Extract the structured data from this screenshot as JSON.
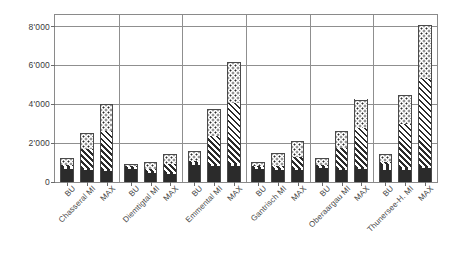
{
  "title": "",
  "chart_data": {
    "type": "bar",
    "subtype": "stacked-grouped",
    "title": "",
    "xlabel": "",
    "ylabel": "",
    "ylim": [
      0,
      8600
    ],
    "yticks": [
      0,
      2000,
      4000,
      6000,
      8000
    ],
    "ytick_labels": [
      "0",
      "2'000",
      "4'000",
      "6'000",
      "8'000"
    ],
    "grid": true,
    "grid_axis": "y",
    "legend": "none",
    "groups": [
      "Chasseral MI",
      "Diemtigtal MI",
      "Emmental MI",
      "Gantrisch MI",
      "Oberaargau MI",
      "Thunersee-H. MI"
    ],
    "bar_labels": [
      "BU",
      "MI",
      "MAX"
    ],
    "categories": [
      "BU",
      "Chasseral MI",
      "MAX",
      "BU",
      "Diemtigtal MI",
      "MAX",
      "BU",
      "Emmental MI",
      "MAX",
      "BU",
      "Gantrisch MI",
      "MAX",
      "BU",
      "Oberaargau MI",
      "MAX",
      "BU",
      "Thunersee-H. MI",
      "MAX"
    ],
    "series": [
      {
        "name": "segment-1-solid",
        "pattern": "solid-black",
        "values": [
          680,
          610,
          580,
          660,
          460,
          430,
          880,
          840,
          850,
          660,
          620,
          620,
          730,
          640,
          650,
          600,
          630,
          700
        ]
      },
      {
        "name": "segment-2-dashed",
        "pattern": "dashed-rows",
        "values": [
          120,
          100,
          95,
          100,
          90,
          90,
          130,
          110,
          110,
          110,
          100,
          100,
          110,
          100,
          100,
          350,
          120,
          110
        ]
      },
      {
        "name": "segment-3-hatched",
        "pattern": "diagonal-hatch",
        "values": [
          60,
          990,
          1940,
          50,
          110,
          430,
          60,
          1430,
          3090,
          60,
          130,
          560,
          60,
          1000,
          2050,
          60,
          2250,
          4520
        ]
      },
      {
        "name": "segment-4-dotted",
        "pattern": "dotted",
        "values": [
          370,
          800,
          1420,
          110,
          370,
          500,
          540,
          1370,
          2150,
          220,
          660,
          810,
          320,
          900,
          1450,
          440,
          1480,
          2770
        ]
      }
    ],
    "totals": [
      1230,
      2500,
      4035,
      920,
      1030,
      1450,
      1610,
      3750,
      6200,
      1050,
      1510,
      2090,
      1220,
      2640,
      4250,
      1450,
      4480,
      8100
    ]
  },
  "bars": [
    {
      "group": "Chasseral MI",
      "label": "BU",
      "segments": [
        680,
        120,
        60,
        370
      ],
      "total": 1230
    },
    {
      "group": "Chasseral MI",
      "label": "MI",
      "segments": [
        610,
        100,
        990,
        800
      ],
      "total": 2500
    },
    {
      "group": "Chasseral MI",
      "label": "MAX",
      "segments": [
        580,
        95,
        1940,
        1420
      ],
      "total": 4035
    },
    {
      "group": "Diemtigtal MI",
      "label": "BU",
      "segments": [
        660,
        100,
        50,
        110
      ],
      "total": 920
    },
    {
      "group": "Diemtigtal MI",
      "label": "MI",
      "segments": [
        460,
        90,
        110,
        370
      ],
      "total": 1030
    },
    {
      "group": "Diemtigtal MI",
      "label": "MAX",
      "segments": [
        430,
        90,
        430,
        500
      ],
      "total": 1450
    },
    {
      "group": "Emmental MI",
      "label": "BU",
      "segments": [
        880,
        130,
        60,
        540
      ],
      "total": 1610
    },
    {
      "group": "Emmental MI",
      "label": "MI",
      "segments": [
        840,
        110,
        1430,
        1370
      ],
      "total": 3750
    },
    {
      "group": "Emmental MI",
      "label": "MAX",
      "segments": [
        850,
        110,
        3090,
        2150
      ],
      "total": 6200
    },
    {
      "group": "Gantrisch MI",
      "label": "BU",
      "segments": [
        660,
        110,
        60,
        220
      ],
      "total": 1050
    },
    {
      "group": "Gantrisch MI",
      "label": "MI",
      "segments": [
        620,
        100,
        130,
        660
      ],
      "total": 1510
    },
    {
      "group": "Gantrisch MI",
      "label": "MAX",
      "segments": [
        620,
        100,
        560,
        810
      ],
      "total": 2090
    },
    {
      "group": "Oberaargau MI",
      "label": "BU",
      "segments": [
        730,
        110,
        60,
        320
      ],
      "total": 1220
    },
    {
      "group": "Oberaargau MI",
      "label": "MI",
      "segments": [
        640,
        100,
        1000,
        900
      ],
      "total": 2640
    },
    {
      "group": "Oberaargau MI",
      "label": "MAX",
      "segments": [
        650,
        100,
        2050,
        1450
      ],
      "total": 4250
    },
    {
      "group": "Thunersee-H. MI",
      "label": "BU",
      "segments": [
        600,
        350,
        60,
        440
      ],
      "total": 1450
    },
    {
      "group": "Thunersee-H. MI",
      "label": "MI",
      "segments": [
        630,
        120,
        2250,
        1480
      ],
      "total": 4480
    },
    {
      "group": "Thunersee-H. MI",
      "label": "MAX",
      "segments": [
        700,
        110,
        4520,
        2770
      ],
      "total": 8100
    }
  ],
  "axis": {
    "y_tick_labels": [
      "8'000",
      "6'000",
      "4'000",
      "2'000",
      "0"
    ],
    "y_tick_values": [
      8000,
      6000,
      4000,
      2000,
      0
    ]
  },
  "x_labels": [
    "BU",
    "Chasseral MI",
    "MAX",
    "BU",
    "Diemtigtal MI",
    "MAX",
    "BU",
    "Emmental MI",
    "MAX",
    "BU",
    "Gantrisch MI",
    "MAX",
    "BU",
    "Oberaargau MI",
    "MAX",
    "BU",
    "Thunersee-H. MI",
    "MAX"
  ],
  "colors": {
    "ink": "#2b2b2b",
    "frame": "#8a8a8a",
    "grid": "#8f8f8f",
    "background": "#ffffff"
  }
}
